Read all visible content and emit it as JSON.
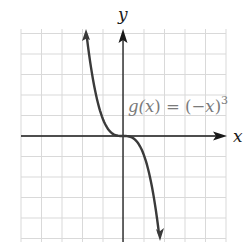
{
  "chart_data": {
    "type": "line",
    "title": "",
    "function_label": "g(x) = (−x)³",
    "xlabel": "x",
    "ylabel": "y",
    "grid": true,
    "series": [
      {
        "name": "g(x) = (−x)³",
        "x": [
          -1.8,
          -1.5,
          -1.0,
          -0.5,
          0,
          0.5,
          1.0,
          1.5,
          1.8
        ],
        "values": [
          5.83,
          3.38,
          1.0,
          0.13,
          0,
          -0.13,
          -1.0,
          -3.38,
          -5.83
        ]
      }
    ],
    "xlim": [
      -5,
      5
    ],
    "ylim": [
      -5,
      5
    ],
    "arrows_on_ends": true
  },
  "labels": {
    "x_axis": "x",
    "y_axis": "y",
    "g_prefix": "g(",
    "g_var": "x",
    "g_mid": ") = (−",
    "g_var2": "x",
    "g_close": ")",
    "g_exp": "3"
  },
  "colors": {
    "grid": "#d9d9d9",
    "axis": "#1a1a1a",
    "curve": "#3a3a3a",
    "label_gray": "#7a7a7a"
  }
}
